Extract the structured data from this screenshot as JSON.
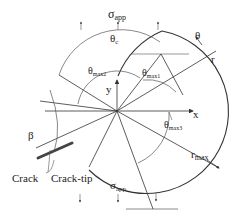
{
  "diagram": {
    "labels": {
      "sigma_top": "σ",
      "sigma_top_sub": "app",
      "sigma_bottom": "σ",
      "sigma_bottom_sub": "app",
      "theta_c": "θ",
      "theta_c_sub": "c",
      "theta_max1": "θ",
      "theta_max1_sub": "max1",
      "theta_max2": "θ",
      "theta_max2_sub": "max2",
      "theta_max3": "θ",
      "theta_max3_sub": "max3",
      "theta": "θ",
      "r": "r",
      "r_max": "r",
      "r_max_sub": "max",
      "x_axis": "x",
      "y_axis": "y",
      "beta": "β",
      "crack": "Crack",
      "crack_tip": "Crack-tip"
    },
    "colors": {
      "line": "#333333",
      "background": "#ffffff"
    }
  }
}
